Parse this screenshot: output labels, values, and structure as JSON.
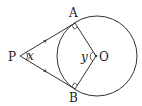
{
  "diagram": {
    "type": "circle-tangents",
    "points": {
      "P": {
        "label": "P"
      },
      "A": {
        "label": "A"
      },
      "B": {
        "label": "B"
      },
      "O": {
        "label": "O"
      }
    },
    "angles": {
      "x": {
        "label": "x",
        "at": "P"
      },
      "y": {
        "label": "y",
        "at": "O"
      }
    },
    "elements": [
      "circle centered O",
      "tangent PA",
      "tangent PB",
      "radius OA",
      "radius OB",
      "right angle at A",
      "right angle at B",
      "equal-length tick on PA",
      "equal-length tick on PB"
    ],
    "stroke_color": "#333333"
  }
}
